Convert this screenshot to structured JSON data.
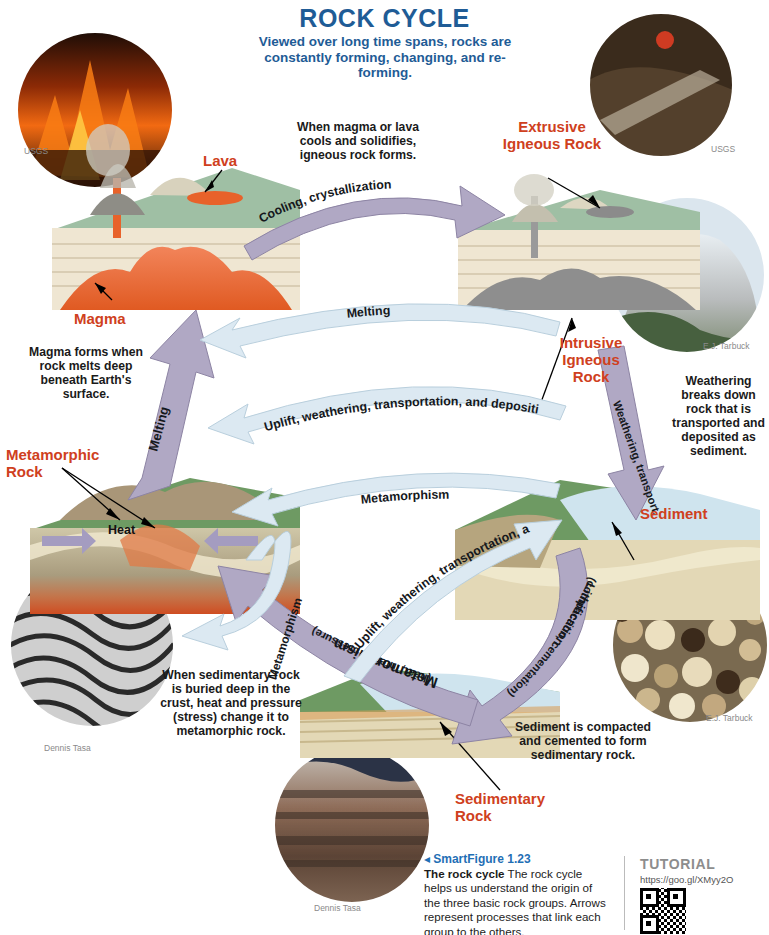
{
  "header": {
    "title": "ROCK CYCLE",
    "subtitle": "Viewed over long time spans, rocks are constantly forming, changing, and re-forming."
  },
  "rock_labels": {
    "lava": "Lava",
    "magma": "Magma",
    "heat": "Heat",
    "extrusive": "Extrusive\nIgneous Rock",
    "extrusive_l1": "Extrusive",
    "extrusive_l2": "Igneous Rock",
    "intrusive_l1": "Intrusive",
    "intrusive_l2": "Igneous",
    "intrusive_l3": "Rock",
    "metamorphic_l1": "Metamorphic",
    "metamorphic_l2": "Rock",
    "sediment": "Sediment",
    "sedimentary_l1": "Sedimentary",
    "sedimentary_l2": "Rock"
  },
  "process_arrows": [
    {
      "id": "cooling",
      "label": "Cooling, crystallization",
      "color": "#b0a8c4"
    },
    {
      "id": "weathering",
      "label": "Weathering, transport, deposition",
      "color": "#b0a8c4"
    },
    {
      "id": "lithification_l1",
      "label": "Lithification",
      "color": "#b0a8c4"
    },
    {
      "id": "lithification_l2",
      "label": "(compaction, cementation)",
      "color": "#b0a8c4"
    },
    {
      "id": "metamorphism_heat_l1",
      "label": "Metamorphism",
      "color": "#b0a8c4"
    },
    {
      "id": "metamorphism_heat_l2",
      "label": "(heat, intense pressure)",
      "color": "#b0a8c4"
    },
    {
      "id": "melting_vertical",
      "label": "Melting",
      "color": "#b0a8c4"
    },
    {
      "id": "melting_horizontal",
      "label": "Melting",
      "color": "#dce9f2"
    },
    {
      "id": "uplift_upper",
      "label": "Uplift, weathering, transportation, and deposition",
      "color": "#dce9f2"
    },
    {
      "id": "uplift_lower",
      "label": "Uplift, weathering, transportation, and deposition",
      "color": "#dce9f2"
    },
    {
      "id": "metamorphism_upper",
      "label": "Metamorphism",
      "color": "#dce9f2"
    },
    {
      "id": "metamorphism_loop",
      "label": "Metamorphism",
      "color": "#dce9f2"
    }
  ],
  "notes": {
    "igneous": "When magma or lava cools and solidifies, igneous rock forms.",
    "magma": "Magma forms when rock melts deep beneath Earth's surface.",
    "weathering": "Weathering breaks down rock that is transported and deposited as sediment.",
    "lithification": "Sediment is compacted and cemented to form sedimentary rock.",
    "metamorphism": "When sedimentary rock is buried deep in the crust, heat and pressure (stress) change it to metamorphic rock."
  },
  "credits": {
    "usgs_left": "USGS",
    "usgs_right": "USGS",
    "tarbuck_rock": "E.J. Tarbuck",
    "tarbuck_sand": "E.J. Tarbuck",
    "tasa_gneiss": "Dennis Tasa",
    "tasa_canyon": "Dennis Tasa"
  },
  "caption": {
    "figure_label": "SmartFigure 1.23",
    "bold_lead": "The rock cycle",
    "body": " The rock cycle helps us understand the origin of the three basic rock groups. Arrows represent processes that link each group to the others.",
    "tutorial_label": "TUTORIAL",
    "tutorial_url": "https://goo.gl/XMyy2O"
  },
  "colors": {
    "title_blue": "#1f5c96",
    "label_red": "#cf4020",
    "purple_arrow": "#b0a8c4",
    "blue_arrow": "#dce9f2",
    "caption_blue": "#1f6fb5"
  }
}
